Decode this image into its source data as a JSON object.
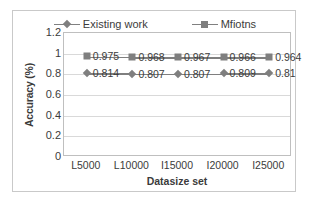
{
  "chart_data": {
    "type": "line",
    "title": "",
    "xlabel": "Datasize set",
    "ylabel": "Accuracy (%)",
    "categories": [
      "L5000",
      "L10000",
      "I15000",
      "I20000",
      "I25000"
    ],
    "series": [
      {
        "name": "Existing work",
        "marker": "diamond-marker",
        "color": "#7f7f7f",
        "values": [
          0.814,
          0.807,
          0.807,
          0.809,
          0.81
        ],
        "labels": [
          "0.814",
          "0.807",
          "0.807",
          "0.809",
          "0.81"
        ]
      },
      {
        "name": "Mfiotns",
        "marker": "square-marker",
        "color": "#7f7f7f",
        "values": [
          0.975,
          0.968,
          0.967,
          0.966,
          0.964
        ],
        "labels": [
          "0.975",
          "0.968",
          "0.967",
          "0.966",
          "0.964"
        ]
      }
    ],
    "ylim": [
      0,
      1.2
    ],
    "yticks": [
      0,
      0.2,
      0.4,
      0.6,
      0.8,
      1,
      1.2
    ],
    "ytick_labels": [
      "0",
      "0.2",
      "0.4",
      "0.6",
      "0.8",
      "1",
      "1.2"
    ],
    "grid": "horizontal",
    "legend_position": "top-center"
  },
  "legend": {
    "entries": [
      {
        "label": "Existing work"
      },
      {
        "label": "Mfiotns"
      }
    ]
  }
}
